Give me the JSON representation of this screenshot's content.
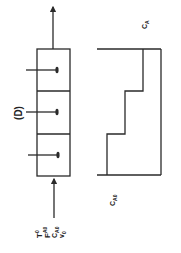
{
  "figure": {
    "label": "(D)"
  },
  "reactor": {
    "tanks": 3,
    "inlet_labels": [
      {
        "main": "T",
        "sub": "0"
      },
      {
        "main": "F",
        "sub": "A0"
      },
      {
        "main": "C",
        "sub": "A0"
      },
      {
        "main": "v",
        "sub": "0"
      }
    ]
  },
  "profile": {
    "start_label": {
      "main": "C",
      "sub": "A0"
    },
    "end_label": {
      "main": "C",
      "sub": "A"
    }
  },
  "colors": {
    "line": "#2a2a2a",
    "background": "#ffffff"
  }
}
